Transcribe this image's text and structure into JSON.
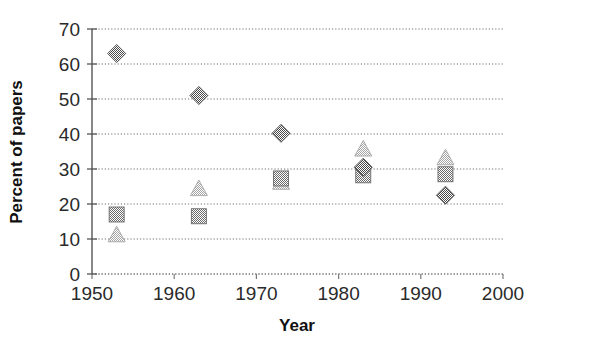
{
  "chart_data": {
    "type": "scatter",
    "title": "",
    "xlabel": "Year",
    "ylabel": "Percent of papers",
    "xlim": [
      1950,
      2000
    ],
    "ylim": [
      0,
      70
    ],
    "xticks": [
      1950,
      1960,
      1970,
      1980,
      1990,
      2000
    ],
    "yticks": [
      0,
      10,
      20,
      30,
      40,
      50,
      60,
      70
    ],
    "xtick_labels": [
      "1950",
      "1960",
      "1970",
      "1980",
      "1990",
      "2000"
    ],
    "ytick_labels": [
      "0",
      "10",
      "20",
      "30",
      "40",
      "50",
      "60",
      "70"
    ],
    "grid": "horizontal-dotted",
    "legend": "none",
    "x": [
      1953,
      1963,
      1973,
      1983,
      1993
    ],
    "series": [
      {
        "name": "diamond-series",
        "marker": "diamond",
        "color": "#6e6e6e",
        "values": [
          63,
          51,
          40.2,
          30.5,
          22.5
        ]
      },
      {
        "name": "square-series",
        "marker": "square",
        "color": "#7a7a7a",
        "values": [
          17,
          16.5,
          27.3,
          28.2,
          28.5
        ]
      },
      {
        "name": "triangle-series",
        "marker": "triangle",
        "color": "#a8a8a8",
        "values": [
          11,
          24.2,
          26,
          35.5,
          33
        ]
      }
    ],
    "annotations": []
  },
  "axes": {
    "x_axis_title": "Year",
    "y_axis_title": "Percent of papers"
  }
}
